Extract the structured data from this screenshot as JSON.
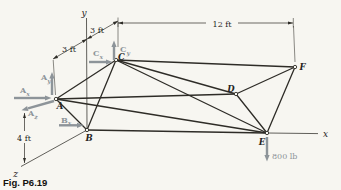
{
  "figure_caption": "Fig. P6.19",
  "axis_labels": {
    "x": "x",
    "y": "y",
    "z": "z"
  },
  "joint_labels": {
    "A": "A",
    "B": "B",
    "C": "C",
    "D": "D",
    "E": "E",
    "F": "F"
  },
  "dimensions": {
    "depth_front": "3 ft",
    "depth_back": "3 ft",
    "span_top": "12 ft",
    "height_left": "4 ft"
  },
  "load": {
    "label": "800 lb"
  },
  "reactions": {
    "Ax": {
      "base": "A",
      "sub": "x"
    },
    "Ay": {
      "base": "A",
      "sub": "y"
    },
    "Az": {
      "base": "A",
      "sub": "z"
    },
    "Bx": {
      "base": "B",
      "sub": "x"
    },
    "Cx": {
      "base": "C",
      "sub": "x"
    },
    "Cy": {
      "base": "C",
      "sub": "y"
    }
  },
  "members": [
    "AB",
    "AC",
    "AD",
    "AE",
    "BC",
    "BE",
    "CD",
    "CE",
    "CF",
    "DE",
    "DF",
    "EF"
  ],
  "colors": {
    "ink": "#2e2c27",
    "reaction_gray": "#8d9499",
    "background": "#f7f6f1"
  }
}
